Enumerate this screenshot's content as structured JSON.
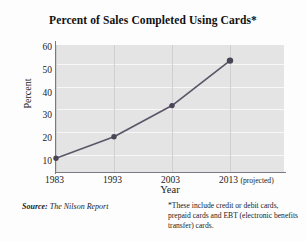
{
  "chart_data": {
    "type": "line",
    "title": "Percent of Sales Completed Using Cards*",
    "xlabel": "Year",
    "ylabel": "Percent",
    "categories": [
      "1983",
      "1993",
      "2003",
      "2013"
    ],
    "x_tick_labels": [
      "1983",
      "1993",
      "2003",
      "2013"
    ],
    "x_tick_suffix": "(projected)",
    "values": [
      7,
      18,
      34,
      57
    ],
    "y_ticks": [
      10,
      20,
      30,
      40,
      50,
      60
    ],
    "ylim": [
      0,
      65
    ],
    "grid": "horizontal-and-vertical",
    "legend": "none",
    "series": [
      {
        "name": "Percent of sales completed using cards",
        "values": [
          7,
          18,
          34,
          57
        ]
      }
    ],
    "line_color": "#5b5668",
    "marker_color": "#4a4555",
    "plot_background": "#e4e4e4"
  },
  "footnotes": {
    "source_lead": "Source:",
    "source_text": " The Nilson Report",
    "note_line1": "*These include credit or debit cards,",
    "note_line2": "prepaid cards and EBT (electronic",
    "note_line3": "benefits transfer) cards."
  }
}
